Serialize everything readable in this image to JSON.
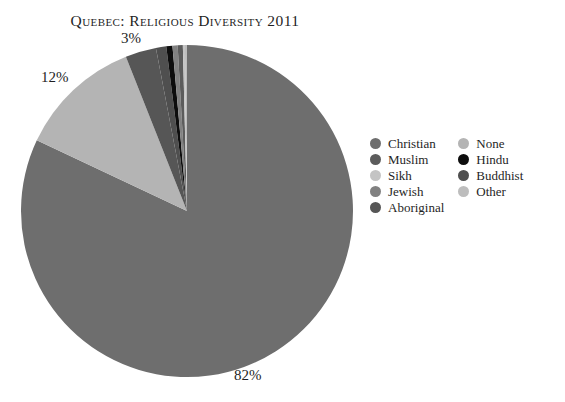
{
  "title": "Quebec: Religious Diversity 2011",
  "background_color": "#ffffff",
  "text_color": "#1f1f1f",
  "legend": {
    "position": "right",
    "columns": [
      {
        "items": [
          {
            "label": "Christian",
            "color": "#6e6e6e",
            "swatch": "legend-dot-christian"
          },
          {
            "label": "Muslim",
            "color": "#5c5c5c",
            "swatch": "legend-dot-muslim"
          },
          {
            "label": "Sikh",
            "color": "#c4c4c4",
            "swatch": "legend-dot-sikh"
          },
          {
            "label": "Jewish",
            "color": "#818181",
            "swatch": "legend-dot-jewish"
          },
          {
            "label": "Aboriginal",
            "color": "#565656",
            "swatch": "legend-dot-aboriginal"
          }
        ]
      },
      {
        "items": [
          {
            "label": "None",
            "color": "#b4b4b4",
            "swatch": "legend-dot-none"
          },
          {
            "label": "Hindu",
            "color": "#0d0d0d",
            "swatch": "legend-dot-hindu"
          },
          {
            "label": "Buddhist",
            "color": "#4f4f4f",
            "swatch": "legend-dot-buddhist"
          },
          {
            "label": "Other",
            "color": "#bdbdbd",
            "swatch": "legend-dot-other"
          }
        ]
      }
    ]
  },
  "pie_labels": {
    "top": "3%",
    "left": "12%",
    "bottom": "82%"
  },
  "chart_data": {
    "type": "pie",
    "title": "Quebec: Religious Diversity 2011",
    "xlabel": "",
    "ylabel": "",
    "start_angle_deg": 0,
    "direction": "clockwise",
    "units": "percent",
    "labels": [
      "Christian",
      "None",
      "Aboriginal",
      "Buddhist",
      "Hindu",
      "Jewish",
      "Muslim",
      "Sikh",
      "Other"
    ],
    "values": [
      82,
      12,
      3,
      1,
      0.6,
      0.5,
      0.5,
      0.2,
      0.2
    ],
    "colors": [
      "#6e6e6e",
      "#b4b4b4",
      "#565656",
      "#4f4f4f",
      "#0d0d0d",
      "#818181",
      "#5c5c5c",
      "#c4c4c4",
      "#bdbdbd"
    ],
    "displayed_value_labels": [
      "82%",
      "12%",
      "3%"
    ],
    "legend_entries": [
      "Christian",
      "Muslim",
      "Sikh",
      "Jewish",
      "Aboriginal",
      "None",
      "Hindu",
      "Buddhist",
      "Other"
    ],
    "grid": false
  }
}
